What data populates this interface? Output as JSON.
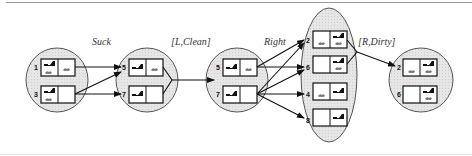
{
  "diagram": {
    "action_labels": {
      "suck": "Suck",
      "l_clean": "[L,Clean]",
      "right": "Right",
      "r_dirty": "[R,Dirty]"
    },
    "belief_states": [
      {
        "id": "b1",
        "states": [
          {
            "num": "1",
            "robot": "L",
            "dirt": [
              "L",
              "R"
            ]
          },
          {
            "num": "3",
            "robot": "L",
            "dirt": [
              "L"
            ]
          }
        ]
      },
      {
        "id": "b2",
        "states": [
          {
            "num": "5",
            "robot": "L",
            "dirt": [
              "R"
            ]
          },
          {
            "num": "7",
            "robot": "L",
            "dirt": []
          }
        ]
      },
      {
        "id": "b3",
        "states": [
          {
            "num": "5",
            "robot": "L",
            "dirt": [
              "R"
            ]
          },
          {
            "num": "7",
            "robot": "L",
            "dirt": []
          }
        ]
      },
      {
        "id": "b4",
        "states": [
          {
            "num": "2",
            "robot": "R",
            "dirt": [
              "L",
              "R"
            ]
          },
          {
            "num": "6",
            "robot": "R",
            "dirt": [
              "R"
            ]
          },
          {
            "num": "4",
            "robot": "R",
            "dirt": [
              "L"
            ]
          },
          {
            "num": "8",
            "robot": "R",
            "dirt": []
          }
        ]
      },
      {
        "id": "b5",
        "states": [
          {
            "num": "2",
            "robot": "R",
            "dirt": [
              "L",
              "R"
            ]
          },
          {
            "num": "6",
            "robot": "R",
            "dirt": [
              "R"
            ]
          }
        ]
      }
    ],
    "labels": {
      "b1s1": "1",
      "b1s2": "3",
      "b2s1": "5",
      "b2s2": "7",
      "b3s1": "5",
      "b3s2": "7",
      "b4s1": "2",
      "b4s2": "6",
      "b4s3": "4",
      "b4s4": "8",
      "b5s1": "2",
      "b5s2": "6"
    },
    "colors": {
      "fill": "#e2e2e2",
      "stroke": "#555555",
      "ink": "#111111"
    }
  }
}
